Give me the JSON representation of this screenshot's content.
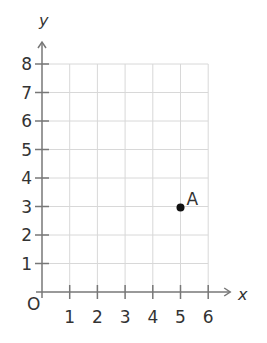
{
  "chart_data": {
    "type": "scatter",
    "title": "",
    "xlabel": "x",
    "ylabel": "y",
    "origin_label": "O",
    "xlim": [
      0,
      6
    ],
    "ylim": [
      0,
      8
    ],
    "x_ticks": [
      "1",
      "2",
      "3",
      "4",
      "5",
      "6"
    ],
    "y_ticks": [
      "1",
      "2",
      "3",
      "4",
      "5",
      "6",
      "7",
      "8"
    ],
    "grid": true,
    "points": [
      {
        "label": "A",
        "x": 5,
        "y": 3
      }
    ]
  },
  "colors": {
    "axis": "#777777",
    "grid": "#d8d8d8",
    "point": "#111111",
    "text": "#333333"
  }
}
